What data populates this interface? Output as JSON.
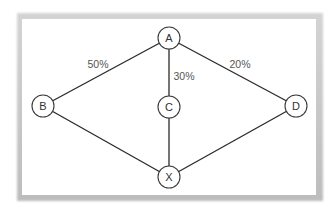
{
  "diagram": {
    "nodes": [
      {
        "id": "A",
        "label": "A",
        "x": 169,
        "y": 38
      },
      {
        "id": "B",
        "label": "B",
        "x": 43,
        "y": 106
      },
      {
        "id": "C",
        "label": "C",
        "x": 169,
        "y": 107
      },
      {
        "id": "D",
        "label": "D",
        "x": 296,
        "y": 106
      },
      {
        "id": "X",
        "label": "X",
        "x": 169,
        "y": 177
      }
    ],
    "edges": [
      {
        "from": "A",
        "to": "B",
        "label": "50%"
      },
      {
        "from": "A",
        "to": "C",
        "label": "30%"
      },
      {
        "from": "A",
        "to": "D",
        "label": "20%"
      },
      {
        "from": "B",
        "to": "X",
        "label": ""
      },
      {
        "from": "C",
        "to": "X",
        "label": ""
      },
      {
        "from": "D",
        "to": "X",
        "label": ""
      }
    ],
    "edge_labels": {
      "ab": "50%",
      "ac": "30%",
      "ad": "20%"
    },
    "node_labels": {
      "a": "A",
      "b": "B",
      "c": "C",
      "d": "D",
      "x": "X"
    }
  }
}
